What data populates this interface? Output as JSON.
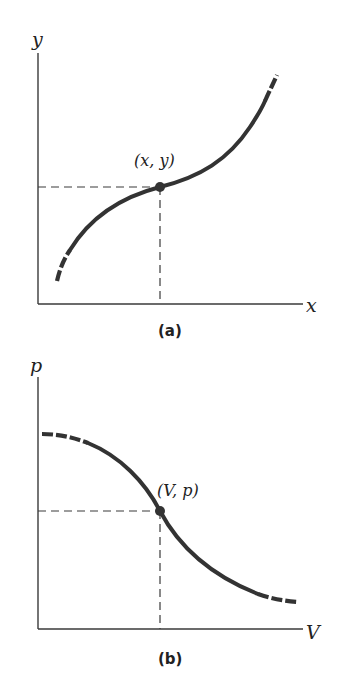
{
  "panels": [
    {
      "id": "a",
      "caption": "(a)",
      "x_axis_label": "x",
      "y_axis_label": "y",
      "point_label": "(x, y)",
      "curve_shape": "increasing S-curve (cubic-like), dashed at both ends",
      "colors": {
        "curve": "#333333",
        "axes": "#3a3a3a"
      }
    },
    {
      "id": "b",
      "caption": "(b)",
      "x_axis_label": "V",
      "y_axis_label": "p",
      "point_label": "(V, p)",
      "curve_shape": "decreasing sigmoid, dashed at both ends",
      "colors": {
        "curve": "#333333",
        "axes": "#3a3a3a"
      }
    }
  ]
}
